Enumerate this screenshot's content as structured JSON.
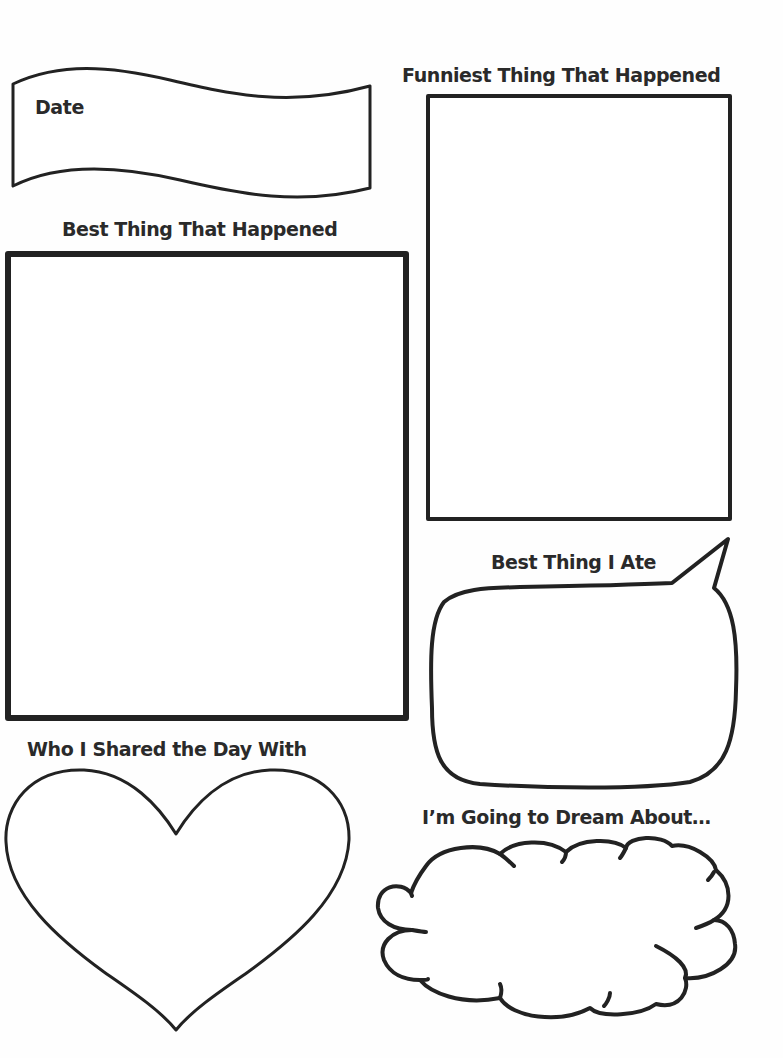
{
  "page": {
    "stroke_color": "#222222",
    "text_color": "#2a2a2a",
    "background": "#fefefe"
  },
  "sections": {
    "date": {
      "label": "Date",
      "shape": "wavy-banner"
    },
    "best_thing": {
      "label": "Best Thing That Happened",
      "shape": "rectangle"
    },
    "funniest_thing": {
      "label": "Funniest Thing That Happened",
      "shape": "rectangle"
    },
    "best_food": {
      "label": "Best Thing I Ate",
      "shape": "speech-bubble"
    },
    "shared_with": {
      "label": "Who I Shared the Day With",
      "shape": "heart"
    },
    "dream_about": {
      "label": "I’m Going to Dream About…",
      "shape": "cloud"
    }
  }
}
